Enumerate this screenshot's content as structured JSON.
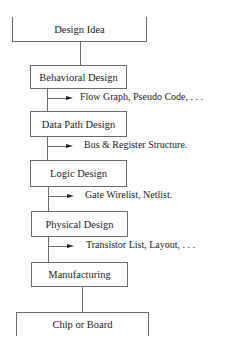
{
  "diagram": {
    "stages": [
      {
        "label": "Design Idea"
      },
      {
        "label": "Behavioral Design"
      },
      {
        "label": "Data Path Design"
      },
      {
        "label": "Logic Design"
      },
      {
        "label": "Physical Design"
      },
      {
        "label": "Manufacturing"
      },
      {
        "label": "Chip or Board"
      }
    ],
    "outputs": [
      {
        "label": "Flow Graph, Pseudo Code, . . ."
      },
      {
        "label": "Bus & Register Structure."
      },
      {
        "label": "Gate Wirelist, Netlist."
      },
      {
        "label": "Transistor List, Layout, . . ."
      }
    ],
    "colors": {
      "line": "#6a6a6a",
      "text": "#222222",
      "background": "#ffffff"
    }
  }
}
